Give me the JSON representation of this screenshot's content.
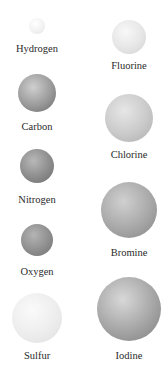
{
  "atoms": [
    {
      "name": "Hydrogen",
      "cx": 37,
      "cy": 26,
      "r": 8,
      "light": "#ffffff",
      "mid": "#f2f2f2",
      "dark": "#e2e2e2",
      "label_y": 43
    },
    {
      "name": "Carbon",
      "cx": 37,
      "cy": 93,
      "r": 19,
      "light": "#cfcfcf",
      "mid": "#9a9a9a",
      "dark": "#6a6a6a",
      "label_y": 121
    },
    {
      "name": "Nitrogen",
      "cx": 37,
      "cy": 166,
      "r": 17,
      "light": "#b8b8b8",
      "mid": "#8c8c8c",
      "dark": "#6c6c6c",
      "label_y": 194
    },
    {
      "name": "Oxygen",
      "cx": 37,
      "cy": 240,
      "r": 16,
      "light": "#b4b4b4",
      "mid": "#8e8e8e",
      "dark": "#707070",
      "label_y": 266
    },
    {
      "name": "Sulfur",
      "cx": 37,
      "cy": 318,
      "r": 25,
      "light": "#fafafa",
      "mid": "#ededed",
      "dark": "#dedede",
      "label_y": 350
    },
    {
      "name": "Fluorine",
      "cx": 129,
      "cy": 37,
      "r": 17,
      "light": "#f8f8f8",
      "mid": "#e6e6e6",
      "dark": "#d0d0d0",
      "label_y": 60
    },
    {
      "name": "Chlorine",
      "cx": 129,
      "cy": 118,
      "r": 24,
      "light": "#e6e6e6",
      "mid": "#cacaca",
      "dark": "#acacac",
      "label_y": 149
    },
    {
      "name": "Bromine",
      "cx": 129,
      "cy": 210,
      "r": 28,
      "light": "#d0d0d0",
      "mid": "#a8a8a8",
      "dark": "#858585",
      "label_y": 247
    },
    {
      "name": "Iodine",
      "cx": 129,
      "cy": 309,
      "r": 32,
      "light": "#d8d8d8",
      "mid": "#a6a6a6",
      "dark": "#7e7e7e",
      "label_y": 350
    }
  ]
}
